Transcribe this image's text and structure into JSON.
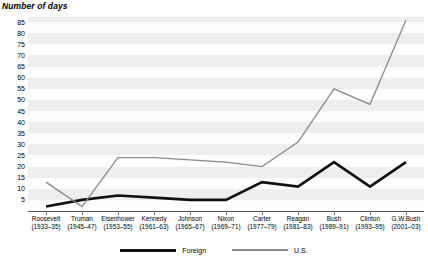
{
  "chart_data": {
    "type": "line",
    "title": "Number of days",
    "xlabel": "",
    "ylabel": "Number of days",
    "ylim": [
      0,
      87
    ],
    "yticks": [
      5,
      10,
      15,
      20,
      25,
      30,
      35,
      40,
      45,
      50,
      55,
      60,
      65,
      70,
      75,
      80,
      85
    ],
    "grid": "horizontal-bands",
    "legend_position": "bottom-center",
    "categories": [
      "Roosevelt (1933–35)",
      "Truman (1945–47)",
      "Eisenhower (1953–55)",
      "Kennedy (1961–63)",
      "Johnson (1965–67)",
      "Nixon (1969–71)",
      "Carter (1977–79)",
      "Reagan (1981–83)",
      "Bush (1989–91)",
      "Clinton (1993–95)",
      "G.W.Bush (2001–03)"
    ],
    "series": [
      {
        "name": "Foreign",
        "color": "#111111",
        "values": [
          2,
          5,
          7,
          6,
          5,
          5,
          13,
          11,
          22,
          11,
          22
        ]
      },
      {
        "name": "U.S.",
        "color": "#8a8a8a",
        "values": [
          13,
          2,
          24,
          24,
          23,
          22,
          20,
          31,
          55,
          48,
          86
        ]
      }
    ]
  },
  "axis": {
    "ytick_labels": [
      "85",
      "80",
      "75",
      "70",
      "65",
      "60",
      "55",
      "50",
      "45",
      "40",
      "35",
      "30",
      "25",
      "20",
      "15",
      "10",
      "5"
    ],
    "xtick_labels": [
      {
        "name": "Roosevelt",
        "years": "(1933–35)"
      },
      {
        "name": "Truman",
        "years": "(1945–47)"
      },
      {
        "name": "Eisenhower",
        "years": "(1953–55)"
      },
      {
        "name": "Kennedy",
        "years": "(1961–63)"
      },
      {
        "name": "Johnson",
        "years": "(1965–67)"
      },
      {
        "name": "Nixon",
        "years": "(1969–71)"
      },
      {
        "name": "Carter",
        "years": "(1977–79)"
      },
      {
        "name": "Reagan",
        "years": "(1981–83)"
      },
      {
        "name": "Bush",
        "years": "(1989–91)"
      },
      {
        "name": "Clinton",
        "years": "(1993–95)"
      },
      {
        "name": "G.W.Bush",
        "years": "(2001–03)"
      }
    ]
  },
  "legend": {
    "items": [
      {
        "label": "Foreign",
        "color": "#111111"
      },
      {
        "label": "U.S.",
        "color": "#8a8a8a"
      }
    ]
  },
  "colors": {
    "foreign": "#111111",
    "us": "#8a8a8a",
    "band": "#eeeeee",
    "axis": "#555555"
  }
}
